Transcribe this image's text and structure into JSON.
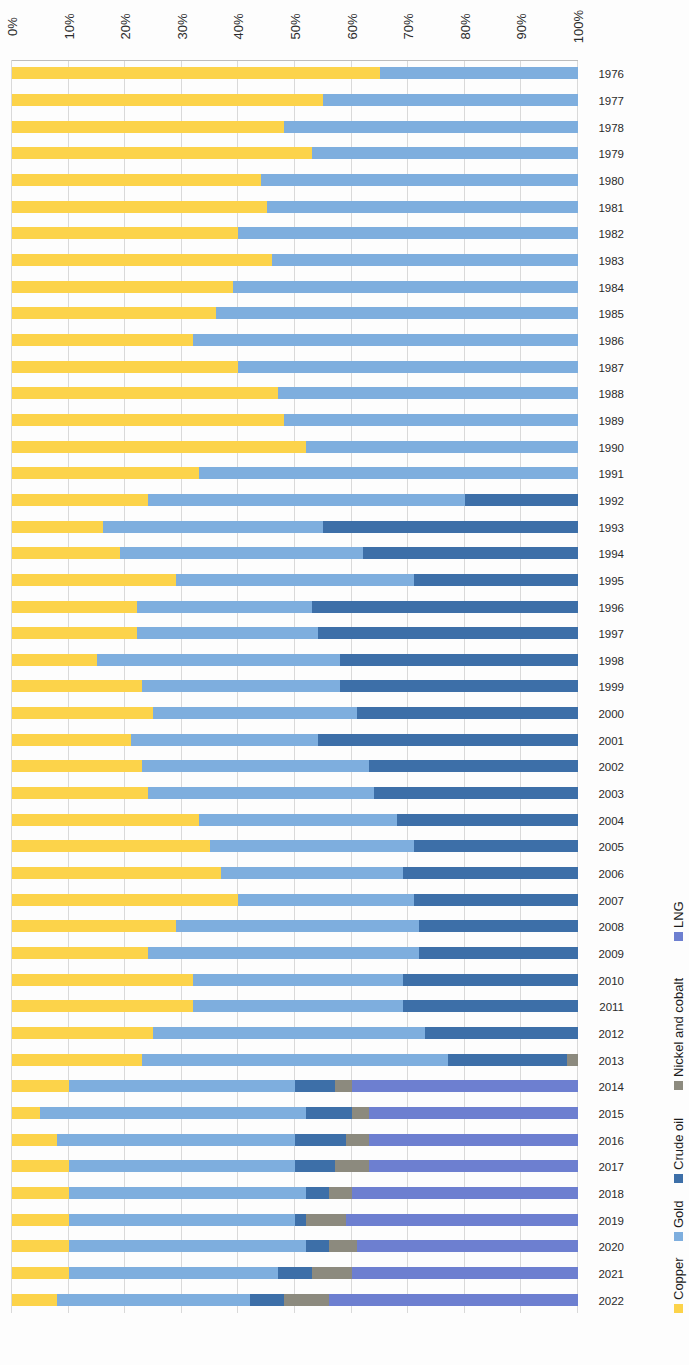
{
  "chart_data": {
    "type": "bar",
    "orientation": "horizontal-stacked-100",
    "title": "",
    "subtitle": "",
    "xlabel": "",
    "ylabel": "",
    "xlim": [
      0,
      100
    ],
    "grid": true,
    "legend_position": "right",
    "tick_labels": [
      "0%",
      "10%",
      "20%",
      "30%",
      "40%",
      "50%",
      "60%",
      "70%",
      "80%",
      "90%",
      "100%"
    ],
    "tick_values": [
      0,
      10,
      20,
      30,
      40,
      50,
      60,
      70,
      80,
      90,
      100
    ],
    "categories": [
      "1976",
      "1977",
      "1978",
      "1979",
      "1980",
      "1981",
      "1982",
      "1983",
      "1984",
      "1985",
      "1986",
      "1987",
      "1988",
      "1989",
      "1990",
      "1991",
      "1992",
      "1993",
      "1994",
      "1995",
      "1996",
      "1997",
      "1998",
      "1999",
      "2000",
      "2001",
      "2002",
      "2003",
      "2004",
      "2005",
      "2006",
      "2007",
      "2008",
      "2009",
      "2010",
      "2011",
      "2012",
      "2013",
      "2014",
      "2015",
      "2016",
      "2017",
      "2018",
      "2019",
      "2020",
      "2021",
      "2022"
    ],
    "series": [
      {
        "name": "Copper",
        "color": "#fcd34a",
        "values": [
          65,
          55,
          48,
          53,
          44,
          45,
          40,
          46,
          39,
          36,
          32,
          40,
          47,
          48,
          52,
          33,
          24,
          16,
          19,
          29,
          22,
          22,
          15,
          23,
          25,
          21,
          23,
          24,
          33,
          35,
          37,
          40,
          29,
          24,
          32,
          32,
          25,
          23,
          10,
          5,
          8,
          10,
          10,
          10,
          10,
          10,
          8
        ]
      },
      {
        "name": "Gold",
        "color": "#7eaede",
        "values": [
          35,
          45,
          52,
          47,
          56,
          55,
          60,
          54,
          61,
          64,
          68,
          60,
          53,
          52,
          48,
          67,
          56,
          39,
          43,
          42,
          31,
          32,
          43,
          35,
          36,
          33,
          40,
          40,
          35,
          36,
          32,
          31,
          43,
          48,
          37,
          37,
          48,
          54,
          40,
          47,
          42,
          40,
          42,
          40,
          42,
          37,
          34
        ]
      },
      {
        "name": "Crude oil",
        "color": "#3d6fa8",
        "values": [
          0,
          0,
          0,
          0,
          0,
          0,
          0,
          0,
          0,
          0,
          0,
          0,
          0,
          0,
          0,
          0,
          20,
          45,
          38,
          29,
          47,
          46,
          42,
          42,
          39,
          46,
          37,
          36,
          32,
          29,
          31,
          29,
          28,
          28,
          31,
          31,
          27,
          21,
          7,
          8,
          9,
          7,
          4,
          2,
          4,
          6,
          6
        ]
      },
      {
        "name": "Nickel and cobalt",
        "color": "#8c8a7e",
        "values": [
          0,
          0,
          0,
          0,
          0,
          0,
          0,
          0,
          0,
          0,
          0,
          0,
          0,
          0,
          0,
          0,
          0,
          0,
          0,
          0,
          0,
          0,
          0,
          0,
          0,
          0,
          0,
          0,
          0,
          0,
          0,
          0,
          0,
          0,
          0,
          0,
          0,
          2,
          3,
          3,
          4,
          6,
          4,
          7,
          5,
          7,
          8
        ]
      },
      {
        "name": "LNG",
        "color": "#6d7fd0",
        "values": [
          0,
          0,
          0,
          0,
          0,
          0,
          0,
          0,
          0,
          0,
          0,
          0,
          0,
          0,
          0,
          0,
          0,
          0,
          0,
          0,
          0,
          0,
          0,
          0,
          0,
          0,
          0,
          0,
          0,
          0,
          0,
          0,
          0,
          0,
          0,
          0,
          0,
          0,
          40,
          37,
          37,
          37,
          40,
          41,
          39,
          40,
          44
        ]
      }
    ]
  },
  "legend": {
    "items": [
      {
        "label": "Copper",
        "color": "#fcd34a"
      },
      {
        "label": "Gold",
        "color": "#7eaede"
      },
      {
        "label": "Crude oil",
        "color": "#3d6fa8"
      },
      {
        "label": "Nickel and cobalt",
        "color": "#8c8a7e"
      },
      {
        "label": "LNG",
        "color": "#6d7fd0"
      }
    ]
  }
}
